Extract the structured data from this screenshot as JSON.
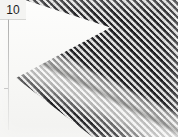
{
  "image": {
    "kind": "macro-photograph",
    "subject": "woven wire mesh screen",
    "background_color": "#fbfbfa",
    "mesh_dark_color": "#17171a",
    "mesh_light_color": "#fafaf8",
    "fold_highlight_color": "#f0f0ec"
  },
  "overlay": {
    "corner_label": {
      "name": "sample-number",
      "text": "10",
      "text_color": "#1d1d1d",
      "chip_color": "#f4f4f2"
    },
    "guide": {
      "name": "vertical-rule",
      "color": "#8c8c8c"
    }
  },
  "regions": {
    "mesh_panel": "woven diamond mesh filling right and upper area",
    "zigzag_edge": "chevron / sawtooth cut along the left side of the mesh",
    "fold_band": "diagonal lighter crease running from upper-left to lower-right",
    "paper_margin": "white background visible at left and bottom"
  }
}
